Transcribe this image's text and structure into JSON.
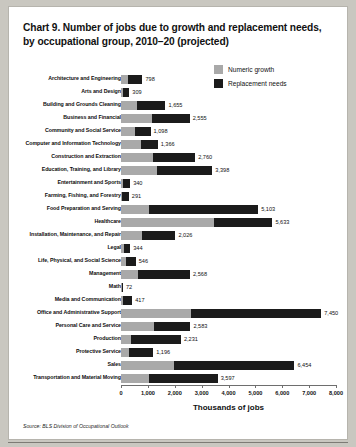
{
  "chart_data": {
    "type": "bar",
    "orientation": "horizontal",
    "stacked": true,
    "title": "Chart 9. Number of jobs due to growth and replacement needs, by occupational group, 2010–20 (projected)",
    "xlabel": "Thousands of jobs",
    "ylabel": "",
    "xlim": [
      0,
      8000
    ],
    "xticks": [
      0,
      1000,
      2000,
      3000,
      4000,
      5000,
      6000,
      7000,
      8000
    ],
    "xtick_labels": [
      "0",
      "1,000",
      "2,000",
      "3,000",
      "4,000",
      "5,000",
      "6,000",
      "7,000",
      "8,000"
    ],
    "grid": false,
    "legend_position": "top-right",
    "source": "Source: BLS Division of Occupational Outlook",
    "colors": {
      "numeric_growth": "#a9a9a9",
      "replacement_needs": "#1b1b1b",
      "axis": "#6e6e6e",
      "card_background": "#ffffff",
      "page_background": "#c9c7c0"
    },
    "series": [
      {
        "name": "Numeric growth",
        "key": "growth"
      },
      {
        "name": "Replacement needs",
        "key": "replacement"
      }
    ],
    "categories": [
      "Architecture and Engineering",
      "Arts and Design",
      "Building and Grounds Cleaning",
      "Business and Financial",
      "Community and Social Service",
      "Computer and Information Technology",
      "Construction and Extraction",
      "Education, Training, and Library",
      "Entertainment and Sports",
      "Farming, Fishing, and Forestry",
      "Food Preparation and Serving",
      "Healthcare",
      "Installation, Maintenance, and Repair",
      "Legal",
      "Life, Physical, and Social Science",
      "Management",
      "Math",
      "Media and Communication",
      "Office and Administrative Support",
      "Personal Care and Service",
      "Production",
      "Protective Service",
      "Sales",
      "Transportation and Material Moving"
    ],
    "totals": [
      798,
      309,
      1655,
      2555,
      1098,
      1366,
      2760,
      3398,
      340,
      291,
      5103,
      5633,
      2026,
      344,
      546,
      2568,
      72,
      417,
      7450,
      2583,
      2231,
      1196,
      6454,
      3597
    ],
    "rows": [
      {
        "category": "Architecture and Engineering",
        "growth": 252,
        "replacement": 546,
        "total": 798,
        "total_label": "798"
      },
      {
        "category": "Arts and Design",
        "growth": 65,
        "replacement": 244,
        "total": 309,
        "total_label": "309"
      },
      {
        "category": "Building and Grounds Cleaning",
        "growth": 595,
        "replacement": 1060,
        "total": 1655,
        "total_label": "1,655"
      },
      {
        "category": "Business and Financial",
        "growth": 1155,
        "replacement": 1400,
        "total": 2555,
        "total_label": "2,555"
      },
      {
        "category": "Community and Social Service",
        "growth": 520,
        "replacement": 578,
        "total": 1098,
        "total_label": "1,098"
      },
      {
        "category": "Computer and Information Technology",
        "growth": 758,
        "replacement": 608,
        "total": 1366,
        "total_label": "1,366"
      },
      {
        "category": "Construction and Extraction",
        "growth": 1175,
        "replacement": 1585,
        "total": 2760,
        "total_label": "2,760"
      },
      {
        "category": "Education, Training, and Library",
        "growth": 1350,
        "replacement": 2048,
        "total": 3398,
        "total_label": "3,398"
      },
      {
        "category": "Entertainment and Sports",
        "growth": 88,
        "replacement": 252,
        "total": 340,
        "total_label": "340"
      },
      {
        "category": "Farming, Fishing, and Forestry",
        "growth": 26,
        "replacement": 265,
        "total": 291,
        "total_label": "291"
      },
      {
        "category": "Food Preparation and Serving",
        "growth": 1030,
        "replacement": 4073,
        "total": 5103,
        "total_label": "5,103"
      },
      {
        "category": "Healthcare",
        "growth": 3450,
        "replacement": 2183,
        "total": 5633,
        "total_label": "5,633"
      },
      {
        "category": "Installation, Maintenance, and Repair",
        "growth": 790,
        "replacement": 1236,
        "total": 2026,
        "total_label": "2,026"
      },
      {
        "category": "Legal",
        "growth": 126,
        "replacement": 218,
        "total": 344,
        "total_label": "344"
      },
      {
        "category": "Life, Physical, and Social Science",
        "growth": 185,
        "replacement": 361,
        "total": 546,
        "total_label": "546"
      },
      {
        "category": "Management",
        "growth": 615,
        "replacement": 1953,
        "total": 2568,
        "total_label": "2,568"
      },
      {
        "category": "Math",
        "growth": 30,
        "replacement": 42,
        "total": 72,
        "total_label": "72"
      },
      {
        "category": "Media and Communication",
        "growth": 70,
        "replacement": 347,
        "total": 417,
        "total_label": "417"
      },
      {
        "category": "Office and Administrative Support",
        "growth": 2600,
        "replacement": 4850,
        "total": 7450,
        "total_label": "7,450"
      },
      {
        "category": "Personal Care and Service",
        "growth": 1240,
        "replacement": 1343,
        "total": 2583,
        "total_label": "2,583"
      },
      {
        "category": "Production",
        "growth": 360,
        "replacement": 1871,
        "total": 2231,
        "total_label": "2,231"
      },
      {
        "category": "Protective Service",
        "growth": 300,
        "replacement": 896,
        "total": 1196,
        "total_label": "1,196"
      },
      {
        "category": "Sales",
        "growth": 1975,
        "replacement": 4479,
        "total": 6454,
        "total_label": "6,454"
      },
      {
        "category": "Transportation and Material Moving",
        "growth": 1030,
        "replacement": 2567,
        "total": 3597,
        "total_label": "3,597"
      }
    ]
  },
  "legend": {
    "items": [
      {
        "label": "Numeric growth",
        "color": "#a9a9a9"
      },
      {
        "label": "Replacement needs",
        "color": "#1b1b1b"
      }
    ]
  },
  "title": "Chart 9. Number of jobs due to growth and replacement needs, by occupational group, 2010–20 (projected)",
  "axis": {
    "xlabel": "Thousands of jobs"
  },
  "source": "Source: BLS Division of Occupational Outlook"
}
